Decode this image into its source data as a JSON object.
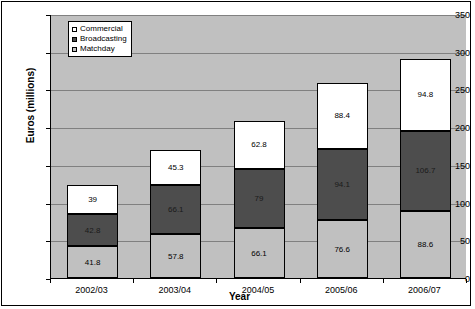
{
  "chart_data": {
    "type": "bar",
    "subtype": "stacked-vertical",
    "title": "",
    "xlabel": "Year",
    "ylabel": "Euros (millions)",
    "categories": [
      "2002/03",
      "2003/04",
      "2004/05",
      "2005/06",
      "2006/07"
    ],
    "series": [
      {
        "name": "Matchday",
        "color": "#c0c0c0",
        "values": [
          41.8,
          57.8,
          66.1,
          76.6,
          88.6
        ]
      },
      {
        "name": "Broadcasting",
        "color": "#4d4d4d",
        "values": [
          42.8,
          66.1,
          79,
          94.1,
          106.7
        ]
      },
      {
        "name": "Commercial",
        "color": "#ffffff",
        "values": [
          39,
          45.3,
          62.8,
          88.4,
          94.8
        ]
      }
    ],
    "data_labels": [
      {
        "category": "2002/03",
        "Matchday": "41.8",
        "Broadcasting": "42.8",
        "Commercial": "39"
      },
      {
        "category": "2003/04",
        "Matchday": "57.8",
        "Broadcasting": "66.1",
        "Commercial": "45.3"
      },
      {
        "category": "2004/05",
        "Matchday": "66.1",
        "Broadcasting": "79",
        "Commercial": "62.8"
      },
      {
        "category": "2005/06",
        "Matchday": "76.6",
        "Broadcasting": "94.1",
        "Commercial": "88.4"
      },
      {
        "category": "2006/07",
        "Matchday": "88.6",
        "Broadcasting": "106.7",
        "Commercial": "94.8"
      }
    ],
    "totals": [
      123.6,
      169.2,
      207.9,
      259.1,
      290.1
    ],
    "ylim": [
      0,
      350
    ],
    "ytick_step": 50,
    "yticks": [
      "0",
      "50",
      "100",
      "150",
      "200",
      "250",
      "300",
      "350"
    ],
    "grid": true,
    "grid_axis": "y",
    "legend_position": "top-left-inside",
    "plot_background": "#c0c0c0",
    "figure_background": "#ffffff",
    "axis_color": "#000000",
    "gridline_color": "#808080"
  },
  "legend": {
    "items": [
      {
        "label": "Commercial",
        "swatch": "commercial"
      },
      {
        "label": "Broadcasting",
        "swatch": "broadcast"
      },
      {
        "label": "Matchday",
        "swatch": "matchday"
      }
    ]
  }
}
